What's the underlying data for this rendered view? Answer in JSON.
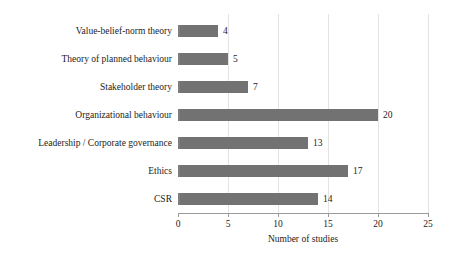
{
  "chart_data": {
    "type": "bar",
    "orientation": "horizontal",
    "title": "",
    "subtitle": "",
    "xlabel": "Number of studies",
    "ylabel": "",
    "categories": [
      "Value-belief-norm theory",
      "Theory of planned behaviour",
      "Stakeholder theory",
      "Organizational behaviour",
      "Leadership / Corporate governance",
      "Ethics",
      "CSR"
    ],
    "values": [
      4,
      5,
      7,
      20,
      13,
      17,
      14
    ],
    "value_labels": [
      "4",
      "5",
      "7",
      "20",
      "13",
      "17",
      "14"
    ],
    "xlim": [
      0,
      25
    ],
    "xticks": [
      0,
      5,
      10,
      15,
      20,
      25
    ],
    "xtick_labels": [
      "0",
      "5",
      "10",
      "15",
      "20",
      "25"
    ],
    "grid": "vertical-only",
    "legend": "none",
    "bar_color": "#777777",
    "gridline_color": "#e3e3e3",
    "axis_color": "#9a9a9a",
    "text_color": "#1c1c1c",
    "background": "#ffffff"
  }
}
